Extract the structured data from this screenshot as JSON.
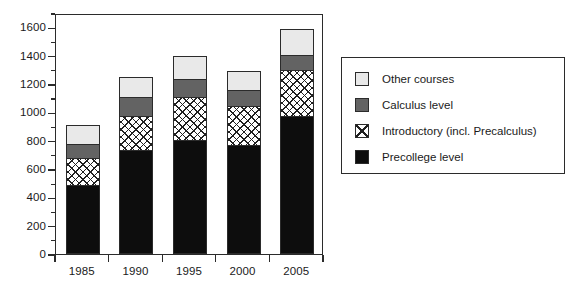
{
  "chart_data": {
    "type": "bar",
    "subtype": "stacked-vertical",
    "title": "",
    "xlabel": "",
    "ylabel": "",
    "categories": [
      "1985",
      "1990",
      "1995",
      "2000",
      "2005"
    ],
    "ylim": [
      0,
      1700
    ],
    "ytick_labels": [
      "0",
      "200",
      "400",
      "600",
      "800",
      "1000",
      "1200",
      "1400",
      "1600"
    ],
    "ytick_values": [
      0,
      200,
      400,
      600,
      800,
      1000,
      1200,
      1400,
      1600
    ],
    "minor_tick_interval": 100,
    "grid": false,
    "legend_position": "right",
    "series": [
      {
        "name": "Precollege level",
        "color": "#0d0d0d",
        "pattern": "solid-black",
        "values": [
          480,
          730,
          800,
          760,
          965
        ]
      },
      {
        "name": "Introductory (incl. Precalculus)",
        "color": "#ffffff",
        "pattern": "cross-hatch",
        "values": [
          190,
          240,
          300,
          280,
          325
        ]
      },
      {
        "name": "Calculus level",
        "color": "#636363",
        "pattern": "solid-dark-gray",
        "values": [
          100,
          130,
          130,
          110,
          110
        ]
      },
      {
        "name": "Other  courses",
        "color": "#e9e9e9",
        "pattern": "solid-light-gray",
        "values": [
          130,
          140,
          160,
          130,
          180
        ]
      }
    ],
    "cumulative_tops": {
      "1985": [
        480,
        670,
        770,
        900
      ],
      "1990": [
        730,
        970,
        1100,
        1240
      ],
      "1995": [
        800,
        1100,
        1230,
        1390
      ],
      "2000": [
        760,
        1040,
        1150,
        1280
      ],
      "2005": [
        965,
        1290,
        1400,
        1580
      ]
    },
    "totals": [
      900,
      1240,
      1390,
      1280,
      1580
    ]
  },
  "legend": {
    "entries": [
      {
        "label": "Other  courses",
        "swatch": "other"
      },
      {
        "label": "Calculus level",
        "swatch": "calculus"
      },
      {
        "label": "Introductory (incl. Precalculus)",
        "swatch": "intro"
      },
      {
        "label": "Precollege level",
        "swatch": "precollege"
      }
    ]
  },
  "axis": {
    "y_labels": [
      "1600",
      "1400",
      "1200",
      "1000",
      "800",
      "600",
      "400",
      "200",
      "0"
    ],
    "x_labels": [
      "1985",
      "1990",
      "1995",
      "2000",
      "2005"
    ]
  },
  "colors": {
    "precollege": "#0d0d0d",
    "intro": "#ffffff",
    "calculus": "#636363",
    "other": "#e9e9e9",
    "axis": "#2b2b2b",
    "background": "#ffffff"
  }
}
